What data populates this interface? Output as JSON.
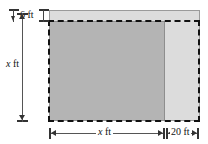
{
  "figure": {
    "type": "geometric-diagram",
    "width_px": 208,
    "height_px": 144
  },
  "shapes": {
    "outer_light_rect": {
      "name": "light-gray-rectangle",
      "fill": "#dcdcdc",
      "stroke": "#9a9a9a",
      "x": 49,
      "y": 10,
      "w": 151,
      "h": 111
    },
    "inner_dark_rect": {
      "name": "dark-gray-square",
      "fill": "#b4b4b4",
      "stroke": "#8e8e8e",
      "x": 49,
      "y": 21,
      "w": 116,
      "h": 100
    },
    "dashed_rect": {
      "name": "dashed-outline-rectangle",
      "stroke": "#111111",
      "style": "dashed",
      "x": 48,
      "y": 20,
      "w": 152,
      "h": 102
    }
  },
  "dimensions": {
    "top_gap": {
      "label": "6 ft",
      "value": 6,
      "unit": "ft",
      "orientation": "vertical"
    },
    "left_height": {
      "label_var": "x",
      "label_unit": "ft",
      "orientation": "vertical"
    },
    "bottom_width": {
      "label_var": "x",
      "label_unit": "ft",
      "orientation": "horizontal"
    },
    "bottom_extension": {
      "label": "20 ft",
      "value": 20,
      "unit": "ft",
      "orientation": "horizontal"
    }
  },
  "colors": {
    "light_fill": "#dcdcdc",
    "dark_fill": "#b4b4b4",
    "dash_stroke": "#111111",
    "dim_line": "#555555",
    "background": "#ffffff"
  }
}
